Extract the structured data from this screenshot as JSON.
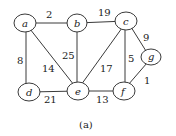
{
  "diagram": {
    "type": "weighted-undirected-graph",
    "caption": "(a)",
    "nodes": [
      {
        "id": "a",
        "label": "a",
        "x": 24,
        "y": 23
      },
      {
        "id": "b",
        "label": "b",
        "x": 77,
        "y": 23
      },
      {
        "id": "c",
        "label": "c",
        "x": 126,
        "y": 21
      },
      {
        "id": "g",
        "label": "g",
        "x": 151,
        "y": 57
      },
      {
        "id": "d",
        "label": "d",
        "x": 29,
        "y": 92
      },
      {
        "id": "e",
        "label": "e",
        "x": 78,
        "y": 91
      },
      {
        "id": "f",
        "label": "f",
        "x": 124,
        "y": 91
      }
    ],
    "edges": [
      {
        "from": "a",
        "to": "b",
        "weight": "2",
        "lx": 49,
        "ly": 18
      },
      {
        "from": "b",
        "to": "c",
        "weight": "19",
        "lx": 103,
        "ly": 16
      },
      {
        "from": "a",
        "to": "d",
        "weight": "8",
        "lx": 20,
        "ly": 60
      },
      {
        "from": "a",
        "to": "e",
        "weight": "14",
        "lx": 48,
        "ly": 68
      },
      {
        "from": "b",
        "to": "e",
        "weight": "25",
        "lx": 69,
        "ly": 55
      },
      {
        "from": "c",
        "to": "e",
        "weight": "17",
        "lx": 106,
        "ly": 68
      },
      {
        "from": "c",
        "to": "f",
        "weight": "5",
        "lx": 130,
        "ly": 58
      },
      {
        "from": "c",
        "to": "g",
        "weight": "9",
        "lx": 145,
        "ly": 38
      },
      {
        "from": "g",
        "to": "f",
        "weight": "1",
        "lx": 145,
        "ly": 82
      },
      {
        "from": "d",
        "to": "e",
        "weight": "21",
        "lx": 50,
        "ly": 102
      },
      {
        "from": "e",
        "to": "f",
        "weight": "13",
        "lx": 101,
        "ly": 102
      }
    ]
  }
}
